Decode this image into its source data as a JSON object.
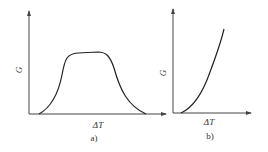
{
  "panels": [
    {
      "id": "a",
      "ylabel": "G",
      "xlabel": "ΔT",
      "caption": "a)",
      "shape": "plateau"
    },
    {
      "id": "b",
      "ylabel": "G",
      "xlabel": "ΔT",
      "caption": "b)",
      "shape": "rising"
    }
  ],
  "colors": {
    "stroke": "#222222",
    "axis": "#444444"
  }
}
